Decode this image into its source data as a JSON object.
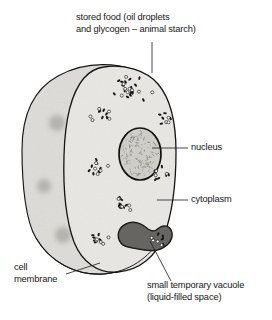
{
  "diagram": {
    "style": "pencil line drawing, greyscale"
  },
  "labels": {
    "stored_food": {
      "line1": "stored food (oil droplets",
      "line2": "and glycogen – animal starch)"
    },
    "nucleus": "nucleus",
    "cytoplasm": "cytoplasm",
    "cell_membrane": {
      "line1": "cell",
      "line2": "membrane"
    },
    "vacuole": {
      "line1": "small temporary vacuole",
      "line2": "(liquid-filled space)"
    }
  },
  "colors": {
    "ink": "#1a1a1a",
    "outline": "#111111",
    "back_fill": "#dedcd8",
    "front_fill": "#e9e7e3",
    "nucleus_fill": "#cfcdc8",
    "vacuole_fill": "#7d7b77",
    "granule_dark": "#141414",
    "granule_open": "#ffffff",
    "page": "#ffffff"
  },
  "geometry": {
    "cell_back_outline": "M22,150 C22,112 36,88 58,76 C78,65 100,63 120,66 C138,69 152,78 160,92 L160,238 C150,258 128,272 104,274 C76,276 50,262 36,238 C26,222 22,186 22,150 Z",
    "cell_front_outline": "M104,67 C124,64 146,70 158,84 C170,98 176,122 176,152 C176,186 172,214 164,236 C156,256 140,270 118,272 C98,274 82,262 74,242 C66,220 63,190 64,156 C65,118 72,92 84,78 C90,71 97,68 104,67 Z",
    "cell_rim": "M36,238 C50,262 76,276 104,274 C128,272 150,258 160,238",
    "nucleus_ellipse": {
      "cx": 140,
      "cy": 154,
      "rx": 21,
      "ry": 26
    },
    "vacuole_path": "M121,243 C116,236 118,228 126,224 C134,220 142,224 148,229 C152,232 156,231 159,228 C164,224 171,226 172,233 C173,241 166,248 157,250 C148,252 139,249 133,248 C128,247 124,247 121,243 Z"
  },
  "leader_lines": [
    {
      "name": "stored-food-leader",
      "x1": 152,
      "y1": 42,
      "x2": 152,
      "y2": 73
    },
    {
      "name": "nucleus-leader",
      "x1": 152,
      "y1": 148,
      "x2": 188,
      "y2": 148
    },
    {
      "name": "cytoplasm-leader",
      "x1": 157,
      "y1": 200,
      "x2": 188,
      "y2": 200
    },
    {
      "name": "cell-membrane-leader",
      "x1": 66,
      "y1": 274,
      "x2": 100,
      "y2": 263
    },
    {
      "name": "vacuole-leader",
      "x1": 150,
      "y1": 241,
      "x2": 171,
      "y2": 281
    }
  ],
  "granule_clusters": [
    {
      "name": "cluster-top-large",
      "cx": 133,
      "cy": 89,
      "rx": 21,
      "ry": 14,
      "filled": 16,
      "open": 9,
      "seed": 11
    },
    {
      "name": "cluster-upper-left",
      "cx": 100,
      "cy": 116,
      "rx": 11,
      "ry": 8,
      "filled": 6,
      "open": 5,
      "seed": 23
    },
    {
      "name": "cluster-upper-right",
      "cx": 163,
      "cy": 118,
      "rx": 8,
      "ry": 7,
      "filled": 5,
      "open": 3,
      "seed": 37
    },
    {
      "name": "cluster-mid-left",
      "cx": 98,
      "cy": 167,
      "rx": 12,
      "ry": 8,
      "filled": 7,
      "open": 5,
      "seed": 45
    },
    {
      "name": "cluster-mid-right",
      "cx": 161,
      "cy": 174,
      "rx": 10,
      "ry": 8,
      "filled": 6,
      "open": 4,
      "seed": 59
    },
    {
      "name": "cluster-center-low",
      "cx": 127,
      "cy": 203,
      "rx": 12,
      "ry": 8,
      "filled": 7,
      "open": 5,
      "seed": 67
    },
    {
      "name": "cluster-bottom-left",
      "cx": 102,
      "cy": 238,
      "rx": 10,
      "ry": 7,
      "filled": 6,
      "open": 5,
      "seed": 73
    },
    {
      "name": "cluster-bottom-right",
      "cx": 159,
      "cy": 240,
      "rx": 8,
      "ry": 6,
      "filled": 4,
      "open": 4,
      "seed": 89
    }
  ],
  "back_smudges": [
    {
      "name": "smudge-upper",
      "cx": 57,
      "cy": 123,
      "r": 8
    },
    {
      "name": "smudge-mid",
      "cx": 44,
      "cy": 186,
      "r": 7
    },
    {
      "name": "smudge-lower",
      "cx": 63,
      "cy": 235,
      "r": 8
    },
    {
      "name": "smudge-top",
      "cx": 88,
      "cy": 93,
      "r": 6
    }
  ]
}
